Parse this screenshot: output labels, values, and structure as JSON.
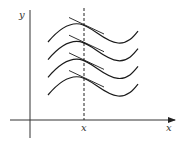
{
  "diagram": {
    "axes": {
      "x_label": "x",
      "y_label": "y",
      "marker_label": "x"
    },
    "curves": {
      "count": 4,
      "offsets_px": [
        0,
        17.7,
        35.4,
        53
      ],
      "tangent_at": "x"
    },
    "colors": {
      "stroke": "#1a1a1a",
      "background": "#ffffff"
    }
  }
}
